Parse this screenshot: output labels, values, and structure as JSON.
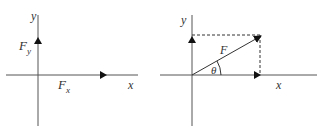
{
  "colors": {
    "axis": "#555555",
    "vector": "#222222",
    "dashed": "#333333",
    "text": "#333333"
  },
  "left_diagram": {
    "axis_labels": {
      "x": "x",
      "y": "y"
    },
    "components": [
      {
        "name": "Fx",
        "symbol": "F",
        "subscript": "x",
        "direction": "along positive x-axis"
      },
      {
        "name": "Fy",
        "symbol": "F",
        "subscript": "y",
        "direction": "along positive y-axis"
      }
    ]
  },
  "right_diagram": {
    "axis_labels": {
      "x": "x",
      "y": "y"
    },
    "vector": {
      "label": "F"
    },
    "angle": {
      "label": "θ"
    },
    "projections": {
      "style": "dashed",
      "targets": [
        "x-axis",
        "y-axis"
      ]
    }
  }
}
